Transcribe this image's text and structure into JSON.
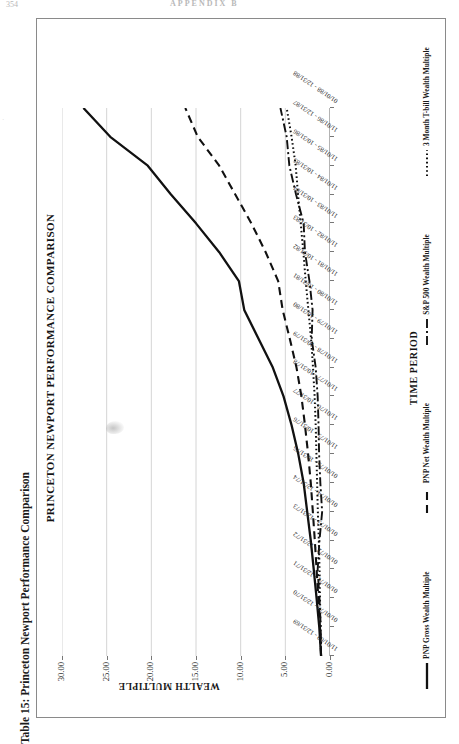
{
  "page": {
    "folio": "354",
    "running_head": "APPENDIX B"
  },
  "caption": "Table 15: Princeton Newport Performance Comparison",
  "chart_data": {
    "type": "line",
    "title": "PRINCETON NEWPORT PERFORMANCE COMPARISON",
    "xlabel": "TIME PERIOD",
    "ylabel": "WEALTH MULTIPLE",
    "ylim": [
      0,
      30
    ],
    "yticks": [
      "0.00",
      "5.00",
      "10.00",
      "15.00",
      "20.00",
      "25.00",
      "30.00"
    ],
    "grid": "vertical",
    "legend_position": "bottom",
    "categories": [
      "11/01/69 - 12/31/69",
      "01/01/70 - 12/31/70",
      "01/01/71 - 12/31/71",
      "01/01/72 - 12/31/72",
      "01/01/73 - 12/31/73",
      "01/01/74 - 12/31/74",
      "01/01/75 - 10/31/75",
      "11/01/75 - 10/31/76",
      "11/01/76 - 10/31/77",
      "11/01/77 - 10/31/78",
      "11/01/78 - 10/31/79",
      "11/01/79 - 10/31/80",
      "11/01/80 - 10/31/81",
      "11/01/81 - 10/31/82",
      "11/01/82 - 10/31/83",
      "11/01/83 - 10/31/84",
      "11/01/84 - 10/31/85",
      "11/01/85 - 10/31/86",
      "11/01/86 - 12/31/87",
      "01/01/88 - 12/31/88"
    ],
    "series": [
      {
        "name": "PNP Gross Wealth Multiple",
        "style": "solid",
        "values": [
          1.0,
          1.2,
          1.5,
          1.82,
          2.15,
          2.55,
          2.95,
          3.55,
          4.3,
          5.2,
          6.4,
          8.0,
          9.6,
          10.2,
          12.4,
          15.0,
          17.8,
          20.4,
          24.6,
          27.6
        ]
      },
      {
        "name": "PNP Net Wealth Multiple",
        "style": "dashed",
        "values": [
          1.0,
          1.12,
          1.3,
          1.5,
          1.7,
          1.92,
          2.15,
          2.45,
          2.8,
          3.2,
          3.75,
          4.5,
          5.3,
          5.8,
          7.2,
          8.8,
          10.6,
          12.4,
          14.8,
          16.2
        ]
      },
      {
        "name": "S&P 500 Wealth Multiple",
        "style": "dash-dot",
        "values": [
          1.0,
          1.04,
          1.18,
          1.38,
          1.18,
          0.88,
          1.08,
          1.22,
          1.28,
          1.38,
          1.6,
          2.05,
          1.95,
          2.3,
          2.8,
          2.95,
          3.8,
          4.55,
          4.85,
          5.55
        ]
      },
      {
        "name": "3 Month T-bill Wealth Multiple",
        "style": "dotted",
        "values": [
          1.0,
          1.07,
          1.12,
          1.17,
          1.25,
          1.36,
          1.44,
          1.52,
          1.6,
          1.72,
          1.9,
          2.12,
          2.42,
          2.72,
          2.98,
          3.28,
          3.58,
          3.84,
          4.3,
          4.85
        ]
      }
    ]
  },
  "legend": [
    {
      "label": "PNP Gross Wealth Multiple",
      "style": "solid"
    },
    {
      "label": "PNP Net Wealth Multiple",
      "style": "dashed"
    },
    {
      "label": "S&P 500 Wealth Multiple",
      "style": "dash-dot"
    },
    {
      "label": "3 Month T-bill Wealth Multiple",
      "style": "dotted"
    }
  ]
}
